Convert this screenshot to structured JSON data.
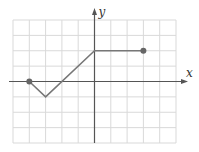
{
  "chart_data": {
    "type": "line",
    "title": "",
    "xlabel": "x",
    "ylabel": "y",
    "xlim": [
      -5,
      5
    ],
    "ylim": [
      -4,
      4
    ],
    "grid": true,
    "legend": null,
    "series": [
      {
        "name": "piecewise linear function",
        "points": [
          [
            -4,
            0
          ],
          [
            -3,
            -1
          ],
          [
            0,
            2
          ],
          [
            3,
            2
          ]
        ],
        "endpoints": {
          "start": [
            -4,
            0
          ],
          "end": [
            3,
            2
          ],
          "style": "closed-dot"
        }
      }
    ]
  },
  "labels": {
    "x_axis": "x",
    "y_axis": "y"
  },
  "colors": {
    "grid": "#d9d9d9",
    "axis": "#555555",
    "line": "#777777",
    "dot": "#666666"
  }
}
